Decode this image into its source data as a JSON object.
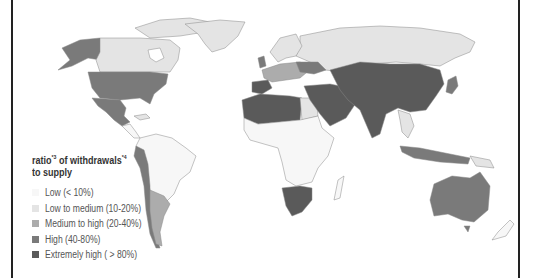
{
  "map": {
    "title": "Ratio of withdrawals to supply",
    "legend": {
      "title_part1": "ratio",
      "title_sup1": "*3",
      "title_part2": " of withdrawals",
      "title_sup2": "*4",
      "title_line2": "to supply",
      "items": [
        {
          "label": "Low (< 10%)",
          "color": "#f7f7f7"
        },
        {
          "label": "Low to medium (10-20%)",
          "color": "#e4e4e4"
        },
        {
          "label": "Medium to high  (20-40%)",
          "color": "#acacac"
        },
        {
          "label": "High (40-80%)",
          "color": "#7a7a7a"
        },
        {
          "label": "Extremely high ( > 80%)",
          "color": "#5a5a5a"
        }
      ]
    },
    "regions": [
      {
        "name": "Canada",
        "category": "Low to medium"
      },
      {
        "name": "Alaska",
        "category": "High"
      },
      {
        "name": "United States",
        "category": "High"
      },
      {
        "name": "Mexico",
        "category": "High"
      },
      {
        "name": "Greenland",
        "category": "Low to medium"
      },
      {
        "name": "South America (most)",
        "category": "Low"
      },
      {
        "name": "Peru",
        "category": "High"
      },
      {
        "name": "Chile",
        "category": "High"
      },
      {
        "name": "Argentina",
        "category": "Medium to high"
      },
      {
        "name": "Russia",
        "category": "Low to medium"
      },
      {
        "name": "Western Europe",
        "category": "Medium to high"
      },
      {
        "name": "Spain",
        "category": "Extremely high"
      },
      {
        "name": "North Africa",
        "category": "Extremely high"
      },
      {
        "name": "Middle East",
        "category": "Extremely high"
      },
      {
        "name": "Central Asia",
        "category": "Extremely high"
      },
      {
        "name": "China",
        "category": "Extremely high"
      },
      {
        "name": "India",
        "category": "Extremely high"
      },
      {
        "name": "Southern Africa",
        "category": "Extremely high"
      },
      {
        "name": "Sub-Saharan Africa",
        "category": "Low"
      },
      {
        "name": "Southeast Asia",
        "category": "Low to medium"
      },
      {
        "name": "Australia",
        "category": "High"
      },
      {
        "name": "New Zealand",
        "category": "Low"
      },
      {
        "name": "Japan",
        "category": "High"
      }
    ]
  }
}
